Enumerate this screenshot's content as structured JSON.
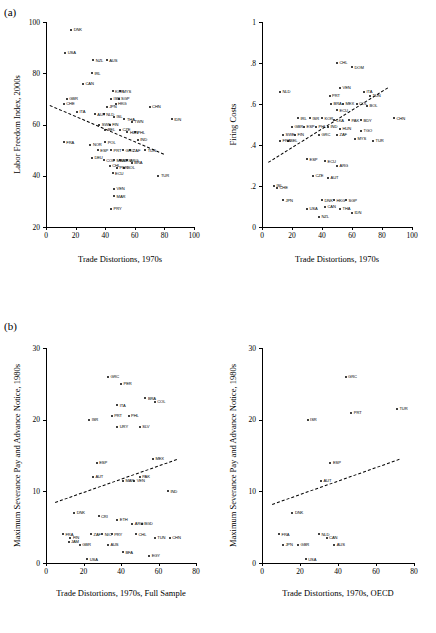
{
  "figure": {
    "panel_a_label": "(a)",
    "panel_b_label": "(b)"
  },
  "chart_data": [
    {
      "id": "a-left",
      "type": "scatter",
      "title": "",
      "xlabel": "Trade Distortions, 1970s",
      "ylabel": "Labor Freedom Index, 2000s",
      "xlim": [
        0,
        100
      ],
      "ylim": [
        20,
        100
      ],
      "xticks": [
        0,
        20,
        40,
        60,
        80,
        100
      ],
      "yticks": [
        20,
        40,
        60,
        80,
        100
      ],
      "grid": false,
      "legend": "none",
      "fit": {
        "x0": 3,
        "y0": 67.5,
        "x1": 80,
        "y1": 48.5,
        "style": "dashed"
      },
      "points": [
        {
          "label": "DNK",
          "x": 17,
          "y": 97
        },
        {
          "label": "USA",
          "x": 13,
          "y": 88
        },
        {
          "label": "NZL",
          "x": 32,
          "y": 85
        },
        {
          "label": "AUS",
          "x": 41,
          "y": 85
        },
        {
          "label": "IRL",
          "x": 31,
          "y": 80
        },
        {
          "label": "CAN",
          "x": 25,
          "y": 76
        },
        {
          "label": "GBR",
          "x": 14,
          "y": 70
        },
        {
          "label": "KOR",
          "x": 45,
          "y": 73
        },
        {
          "label": "MYS",
          "x": 50,
          "y": 73
        },
        {
          "label": "CHE",
          "x": 12,
          "y": 68
        },
        {
          "label": "ISR",
          "x": 44,
          "y": 70
        },
        {
          "label": "SGP",
          "x": 49,
          "y": 70
        },
        {
          "label": "JPN",
          "x": 41,
          "y": 67
        },
        {
          "label": "HKG",
          "x": 47,
          "y": 68
        },
        {
          "label": "ITA",
          "x": 21,
          "y": 65
        },
        {
          "label": "AUT",
          "x": 33,
          "y": 64
        },
        {
          "label": "NLD",
          "x": 39,
          "y": 64
        },
        {
          "label": "ISL",
          "x": 46,
          "y": 63
        },
        {
          "label": "CHN",
          "x": 70,
          "y": 67
        },
        {
          "label": "THA",
          "x": 53,
          "y": 62
        },
        {
          "label": "SWE",
          "x": 36,
          "y": 60
        },
        {
          "label": "FIN",
          "x": 43,
          "y": 60
        },
        {
          "label": "TWN",
          "x": 58,
          "y": 61
        },
        {
          "label": "IDN",
          "x": 85,
          "y": 62
        },
        {
          "label": "BEL",
          "x": 40,
          "y": 58
        },
        {
          "label": "CZE",
          "x": 50,
          "y": 58
        },
        {
          "label": "HUN",
          "x": 55,
          "y": 57
        },
        {
          "label": "PHL",
          "x": 60,
          "y": 57
        },
        {
          "label": "FRA",
          "x": 12,
          "y": 53
        },
        {
          "label": "NOR",
          "x": 30,
          "y": 52
        },
        {
          "label": "POL",
          "x": 40,
          "y": 53
        },
        {
          "label": "IND",
          "x": 62,
          "y": 54
        },
        {
          "label": "ESP",
          "x": 35,
          "y": 50
        },
        {
          "label": "PRT",
          "x": 44,
          "y": 50
        },
        {
          "label": "GRC",
          "x": 52,
          "y": 50
        },
        {
          "label": "ZAF",
          "x": 57,
          "y": 50
        },
        {
          "label": "TUN",
          "x": 67,
          "y": 50
        },
        {
          "label": "DEU",
          "x": 31,
          "y": 47
        },
        {
          "label": "COL",
          "x": 39,
          "y": 46
        },
        {
          "label": "MAR",
          "x": 46,
          "y": 46
        },
        {
          "label": "MEX",
          "x": 50,
          "y": 46
        },
        {
          "label": "ARG",
          "x": 55,
          "y": 46
        },
        {
          "label": "BRA",
          "x": 58,
          "y": 45
        },
        {
          "label": "CHL",
          "x": 43,
          "y": 44
        },
        {
          "label": "PER",
          "x": 48,
          "y": 43
        },
        {
          "label": "BOL",
          "x": 53,
          "y": 43
        },
        {
          "label": "ECU",
          "x": 45,
          "y": 41
        },
        {
          "label": "TUR",
          "x": 76,
          "y": 40
        },
        {
          "label": "VEN",
          "x": 46,
          "y": 35
        },
        {
          "label": "MAR2",
          "x": 46,
          "y": 32
        },
        {
          "label": "PRY",
          "x": 44,
          "y": 27
        }
      ]
    },
    {
      "id": "a-right",
      "type": "scatter",
      "title": "",
      "xlabel": "Trade Distortions, 1970s",
      "ylabel": "Firing Costs",
      "xlim": [
        0,
        100
      ],
      "ylim": [
        0,
        1
      ],
      "xticks": [
        0,
        20,
        40,
        60,
        80,
        100
      ],
      "yticks": [
        0,
        0.2,
        0.4,
        0.6,
        0.8,
        1
      ],
      "ytick_labels": [
        "0",
        ".2",
        ".4",
        ".6",
        ".8",
        "1"
      ],
      "grid": false,
      "legend": "none",
      "fit": {
        "x0": 4,
        "y0": 0.315,
        "x1": 84,
        "y1": 0.68,
        "style": "dashed"
      },
      "points": [
        {
          "label": "CHL",
          "x": 50,
          "y": 0.8
        },
        {
          "label": "DOM",
          "x": 60,
          "y": 0.78
        },
        {
          "label": "NLD",
          "x": 12,
          "y": 0.66
        },
        {
          "label": "VEN",
          "x": 52,
          "y": 0.68
        },
        {
          "label": "PRT",
          "x": 45,
          "y": 0.64
        },
        {
          "label": "ITA",
          "x": 68,
          "y": 0.66
        },
        {
          "label": "TUN",
          "x": 72,
          "y": 0.64
        },
        {
          "label": "BRA",
          "x": 46,
          "y": 0.6
        },
        {
          "label": "MEX",
          "x": 54,
          "y": 0.6
        },
        {
          "label": "COL",
          "x": 63,
          "y": 0.6
        },
        {
          "label": "BOL",
          "x": 70,
          "y": 0.59
        },
        {
          "label": "ECU",
          "x": 50,
          "y": 0.57
        },
        {
          "label": "IRL",
          "x": 24,
          "y": 0.53
        },
        {
          "label": "ISR",
          "x": 32,
          "y": 0.53
        },
        {
          "label": "KOR",
          "x": 40,
          "y": 0.53
        },
        {
          "label": "LKA",
          "x": 48,
          "y": 0.52
        },
        {
          "label": "PAK",
          "x": 58,
          "y": 0.52
        },
        {
          "label": "BDY",
          "x": 66,
          "y": 0.52
        },
        {
          "label": "CHN",
          "x": 88,
          "y": 0.53
        },
        {
          "label": "GBR",
          "x": 20,
          "y": 0.49
        },
        {
          "label": "ESP",
          "x": 28,
          "y": 0.49
        },
        {
          "label": "PHL",
          "x": 36,
          "y": 0.49
        },
        {
          "label": "IND",
          "x": 44,
          "y": 0.49
        },
        {
          "label": "HUN",
          "x": 52,
          "y": 0.48
        },
        {
          "label": "TGO",
          "x": 66,
          "y": 0.47
        },
        {
          "label": "SWE",
          "x": 14,
          "y": 0.45
        },
        {
          "label": "FIN",
          "x": 22,
          "y": 0.45
        },
        {
          "label": "GRC",
          "x": 38,
          "y": 0.45
        },
        {
          "label": "ZAF",
          "x": 50,
          "y": 0.45
        },
        {
          "label": "MYS",
          "x": 62,
          "y": 0.43
        },
        {
          "label": "TUR",
          "x": 74,
          "y": 0.42
        },
        {
          "label": "FRA",
          "x": 12,
          "y": 0.42
        },
        {
          "label": "BEL",
          "x": 17,
          "y": 0.42
        },
        {
          "label": "ESP2",
          "x": 30,
          "y": 0.33
        },
        {
          "label": "ECU2",
          "x": 42,
          "y": 0.32
        },
        {
          "label": "ARG",
          "x": 50,
          "y": 0.3
        },
        {
          "label": "CZE",
          "x": 34,
          "y": 0.25
        },
        {
          "label": "AUT",
          "x": 44,
          "y": 0.24
        },
        {
          "label": "ISL",
          "x": 8,
          "y": 0.2
        },
        {
          "label": "CHE",
          "x": 10,
          "y": 0.19
        },
        {
          "label": "JPN",
          "x": 14,
          "y": 0.13
        },
        {
          "label": "DNK",
          "x": 40,
          "y": 0.13
        },
        {
          "label": "HKG",
          "x": 48,
          "y": 0.13
        },
        {
          "label": "SGP",
          "x": 56,
          "y": 0.13
        },
        {
          "label": "CAN",
          "x": 42,
          "y": 0.1
        },
        {
          "label": "USA",
          "x": 30,
          "y": 0.09
        },
        {
          "label": "NZL",
          "x": 38,
          "y": 0.05
        },
        {
          "label": "THA",
          "x": 52,
          "y": 0.09
        },
        {
          "label": "IDN",
          "x": 60,
          "y": 0.07
        }
      ]
    },
    {
      "id": "b-left",
      "type": "scatter",
      "title": "",
      "xlabel": "Trade Distortions, 1970s, Full Sample",
      "ylabel": "Maximum Severance Pay and Advance Notice, 1980s",
      "xlim": [
        0,
        80
      ],
      "ylim": [
        0,
        30
      ],
      "xticks": [
        0,
        20,
        40,
        60,
        80
      ],
      "yticks": [
        0,
        10,
        20,
        30
      ],
      "grid": false,
      "legend": "none",
      "fit": {
        "x0": 5,
        "y0": 8.5,
        "x1": 70,
        "y1": 14.5,
        "style": "dashed"
      },
      "points": [
        {
          "label": "GRC",
          "x": 33,
          "y": 26
        },
        {
          "label": "PER",
          "x": 40,
          "y": 25
        },
        {
          "label": "BRA",
          "x": 53,
          "y": 23
        },
        {
          "label": "COL",
          "x": 58,
          "y": 22.5
        },
        {
          "label": "ITA",
          "x": 38,
          "y": 22
        },
        {
          "label": "ISR",
          "x": 23,
          "y": 20
        },
        {
          "label": "PRT",
          "x": 35,
          "y": 20.5
        },
        {
          "label": "PHL",
          "x": 44,
          "y": 20.5
        },
        {
          "label": "URY",
          "x": 38,
          "y": 19
        },
        {
          "label": "SLV",
          "x": 50,
          "y": 19
        },
        {
          "label": "ESP",
          "x": 27,
          "y": 14
        },
        {
          "label": "MEX",
          "x": 57,
          "y": 14.5
        },
        {
          "label": "AUT",
          "x": 25,
          "y": 12
        },
        {
          "label": "PAK",
          "x": 50,
          "y": 12
        },
        {
          "label": "MAR",
          "x": 41,
          "y": 11.5
        },
        {
          "label": "VEN",
          "x": 47,
          "y": 11.5
        },
        {
          "label": "IND",
          "x": 65,
          "y": 10
        },
        {
          "label": "DNK",
          "x": 15,
          "y": 7
        },
        {
          "label": "CRI",
          "x": 28,
          "y": 6.5
        },
        {
          "label": "ETH",
          "x": 38,
          "y": 6
        },
        {
          "label": "ARG",
          "x": 46,
          "y": 5.5
        },
        {
          "label": "BGD",
          "x": 51,
          "y": 5.5
        },
        {
          "label": "FRA",
          "x": 9,
          "y": 4
        },
        {
          "label": "FIN",
          "x": 13,
          "y": 3.5
        },
        {
          "label": "JAM",
          "x": 12,
          "y": 3
        },
        {
          "label": "ZAF",
          "x": 24,
          "y": 4
        },
        {
          "label": "NIC",
          "x": 30,
          "y": 4
        },
        {
          "label": "PRY",
          "x": 35,
          "y": 4
        },
        {
          "label": "CHL",
          "x": 48,
          "y": 4
        },
        {
          "label": "TUN",
          "x": 58,
          "y": 3.5
        },
        {
          "label": "CHN",
          "x": 66,
          "y": 3.5
        },
        {
          "label": "GBR",
          "x": 18,
          "y": 2.5
        },
        {
          "label": "AUS",
          "x": 33,
          "y": 2.5
        },
        {
          "label": "BFA",
          "x": 41,
          "y": 1.5
        },
        {
          "label": "USA",
          "x": 22,
          "y": 0.5
        },
        {
          "label": "EGY",
          "x": 55,
          "y": 1
        }
      ]
    },
    {
      "id": "b-right",
      "type": "scatter",
      "title": "",
      "xlabel": "Trade Distortions, 1970s, OECD",
      "ylabel": "Maximum Severance Pay and Advance Notice, 1980s",
      "xlim": [
        0,
        80
      ],
      "ylim": [
        0,
        30
      ],
      "xticks": [
        0,
        20,
        40,
        60,
        80
      ],
      "yticks": [
        0,
        10,
        20,
        30
      ],
      "grid": false,
      "legend": "none",
      "fit": {
        "x0": 5,
        "y0": 8.2,
        "x1": 72,
        "y1": 14.5,
        "style": "dashed"
      },
      "points": [
        {
          "label": "GRC",
          "x": 44,
          "y": 26
        },
        {
          "label": "TUR",
          "x": 71,
          "y": 21.5
        },
        {
          "label": "PRT",
          "x": 47,
          "y": 21
        },
        {
          "label": "ISR",
          "x": 24,
          "y": 20
        },
        {
          "label": "ESP",
          "x": 36,
          "y": 14
        },
        {
          "label": "AUT",
          "x": 31,
          "y": 11.5
        },
        {
          "label": "DNK",
          "x": 16,
          "y": 7
        },
        {
          "label": "FRA",
          "x": 9,
          "y": 4
        },
        {
          "label": "NLD",
          "x": 30,
          "y": 4
        },
        {
          "label": "CAN",
          "x": 34,
          "y": 3.5
        },
        {
          "label": "JPN",
          "x": 11,
          "y": 2.5
        },
        {
          "label": "GBR",
          "x": 19,
          "y": 2.5
        },
        {
          "label": "AUS",
          "x": 38,
          "y": 2.5
        },
        {
          "label": "USA",
          "x": 23,
          "y": 0.5
        }
      ]
    }
  ]
}
